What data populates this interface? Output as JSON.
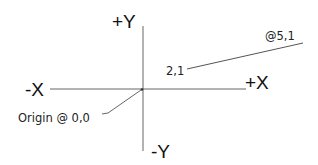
{
  "diagram": {
    "axes": {
      "pos_y_label": "+Y",
      "neg_y_label": "-Y",
      "pos_x_label": "+X",
      "neg_x_label": "-X"
    },
    "annotations": {
      "origin_label": "Origin @ 0,0",
      "line_start_label": "2,1",
      "line_end_label": "@5,1"
    },
    "colors": {
      "line": "#555555",
      "text": "#111111",
      "background": "#ffffff"
    }
  }
}
